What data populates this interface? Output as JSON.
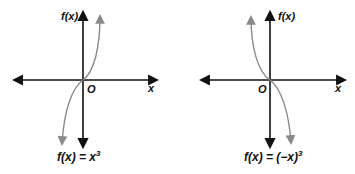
{
  "figure": {
    "colors": {
      "axis": "#111111",
      "curve": "#8a8a8a",
      "background": "#ffffff"
    },
    "graphs": [
      {
        "id": "left",
        "y_axis_label": "f(x)",
        "x_axis_label": "x",
        "origin_label": "O",
        "caption_main": "f(x) = x",
        "caption_exp": "3",
        "function": "x^3"
      },
      {
        "id": "right",
        "y_axis_label": "f(x)",
        "x_axis_label": "x",
        "origin_label": "O",
        "caption_main": "f(x) = (−x)",
        "caption_exp": "3",
        "function": "(-x)^3"
      }
    ]
  }
}
